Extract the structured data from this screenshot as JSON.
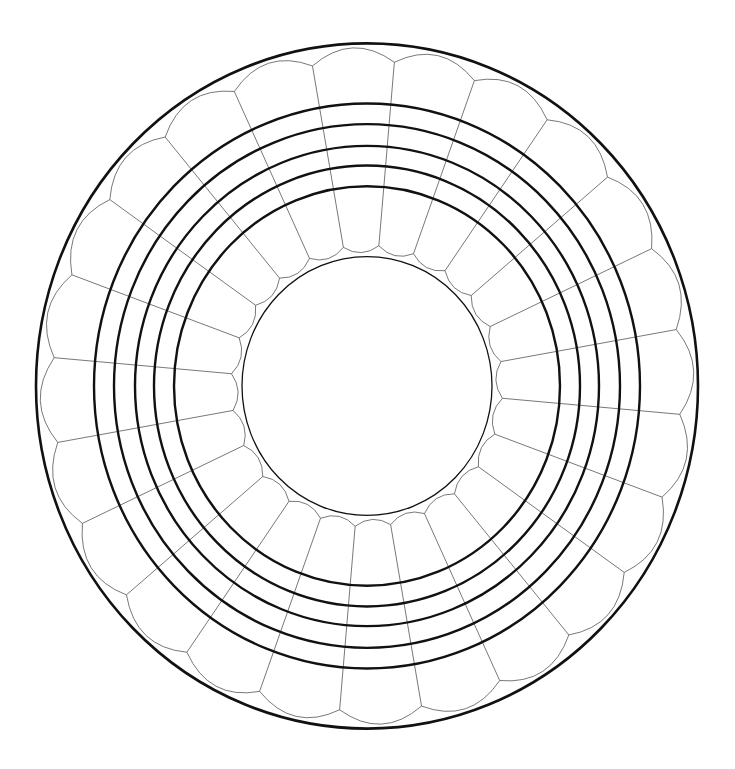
{
  "canvas": {
    "width": 735,
    "height": 769,
    "background": "#ffffff"
  },
  "diagram": {
    "center": {
      "x": 367,
      "y": 386
    },
    "y_scale": 1.035,
    "segment_count": 24,
    "spoke_offset_deg": 5,
    "colors": {
      "thick_line": "#111111",
      "thin_line": "#555555"
    },
    "outer_boundary": {
      "rx": 331,
      "stroke_width": 2.6
    },
    "outer_scallops": {
      "vertex_r": 314,
      "bulge_r": 327,
      "stroke_width": 0.8
    },
    "rings": [
      {
        "rx": 193,
        "stroke_width": 2.4
      },
      {
        "rx": 213,
        "stroke_width": 2.4
      },
      {
        "rx": 232,
        "stroke_width": 2.4
      },
      {
        "rx": 253,
        "stroke_width": 2.4
      },
      {
        "rx": 273,
        "stroke_width": 2.4
      }
    ],
    "inner_scallops": {
      "vertex_r": 136,
      "bulge_r": 129,
      "stroke_width": 0.8
    },
    "inner_circle": {
      "rx": 125,
      "stroke_width": 1.3
    },
    "spokes": {
      "stroke_width": 0.8
    }
  }
}
